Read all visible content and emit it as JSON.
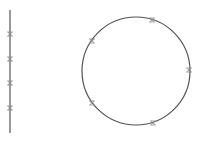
{
  "diagram": {
    "stroke_color": "#555555",
    "marker_color": "#888888",
    "line": {
      "x": 10,
      "y1": 10,
      "y2": 133,
      "markers_y": [
        34,
        59,
        83,
        108
      ]
    },
    "circle": {
      "cx": 136,
      "cy": 71,
      "r": 54,
      "markers": [
        [
          152,
          20
        ],
        [
          92,
          41
        ],
        [
          189,
          70
        ],
        [
          92,
          103
        ],
        [
          153,
          123
        ]
      ]
    }
  }
}
